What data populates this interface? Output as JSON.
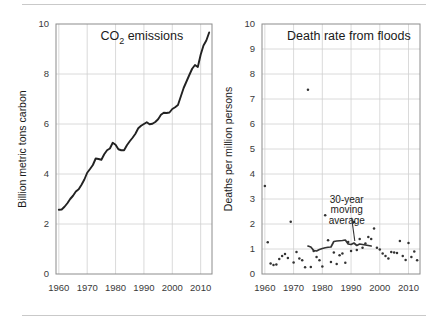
{
  "figure": {
    "background": "#ffffff",
    "ink": "#222222",
    "grid_color": "#d0d0d0",
    "frame_color": "#8c8c8c",
    "rule_top": true,
    "rule_bottom": true
  },
  "chart_data": [
    {
      "id": "co2-emissions",
      "type": "line",
      "title": "CO2 emissions",
      "title_parts": {
        "main": "CO",
        "sub": "2",
        "tail": " emissions"
      },
      "xlabel": "",
      "ylabel": "Billion metric tons carbon",
      "xlim": [
        1959,
        2014
      ],
      "ylim": [
        0,
        10
      ],
      "xticks": [
        1960,
        1970,
        1980,
        1990,
        2000,
        2010
      ],
      "xticklabels": [
        "1960",
        "1970",
        "1980",
        "1990",
        "2000",
        "2010"
      ],
      "yticks": [
        0,
        2,
        4,
        6,
        8,
        10
      ],
      "yticklabels": [
        "0",
        "2",
        "4",
        "6",
        "8",
        "10"
      ],
      "grid": true,
      "legend": "none",
      "series": [
        {
          "name": "Global CO2 emissions",
          "color": "#222222",
          "x": [
            1960,
            1961,
            1962,
            1963,
            1964,
            1965,
            1966,
            1967,
            1968,
            1969,
            1970,
            1971,
            1972,
            1973,
            1974,
            1975,
            1976,
            1977,
            1978,
            1979,
            1980,
            1981,
            1982,
            1983,
            1984,
            1985,
            1986,
            1987,
            1988,
            1989,
            1990,
            1991,
            1992,
            1993,
            1994,
            1995,
            1996,
            1997,
            1998,
            1999,
            2000,
            2001,
            2002,
            2003,
            2004,
            2005,
            2006,
            2007,
            2008,
            2009,
            2010,
            2011,
            2012,
            2013
          ],
          "values": [
            2.57,
            2.58,
            2.69,
            2.83,
            3.0,
            3.13,
            3.3,
            3.39,
            3.57,
            3.78,
            4.05,
            4.2,
            4.36,
            4.62,
            4.6,
            4.57,
            4.79,
            4.95,
            5.02,
            5.25,
            5.17,
            4.99,
            4.95,
            4.95,
            5.15,
            5.31,
            5.45,
            5.61,
            5.83,
            5.93,
            6.0,
            6.07,
            5.99,
            6.01,
            6.08,
            6.19,
            6.37,
            6.45,
            6.44,
            6.46,
            6.6,
            6.67,
            6.76,
            7.1,
            7.44,
            7.7,
            7.96,
            8.21,
            8.36,
            8.28,
            8.77,
            9.14,
            9.34,
            9.66
          ]
        }
      ]
    },
    {
      "id": "flood-death-rate",
      "type": "scatter",
      "title": "Death rate from floods",
      "xlabel": "",
      "ylabel": "Deaths per million persons",
      "xlim": [
        1959,
        2014
      ],
      "ylim": [
        0,
        10
      ],
      "xticks": [
        1960,
        1970,
        1980,
        1990,
        2000,
        2010
      ],
      "xticklabels": [
        "1960",
        "1970",
        "1980",
        "1990",
        "2000",
        "2010"
      ],
      "yticks": [
        0,
        1,
        2,
        3,
        4,
        5,
        6,
        7,
        8,
        9,
        10
      ],
      "yticklabels": [
        "0",
        "1",
        "2",
        "3",
        "4",
        "5",
        "6",
        "7",
        "8",
        "9",
        "10"
      ],
      "grid": true,
      "legend": "none",
      "annotation": {
        "text_lines": [
          "30-year",
          "moving",
          "average"
        ],
        "text_x": 1988.5,
        "text_y": 2.85,
        "leader_from": [
          1990.2,
          2.25
        ],
        "leader_to": [
          1991.3,
          1.32
        ]
      },
      "series": [
        {
          "name": "Annual flood death rate",
          "type": "scatter",
          "color": "#333333",
          "points": [
            [
              1960,
              3.52
            ],
            [
              1961,
              1.27
            ],
            [
              1962,
              0.42
            ],
            [
              1963,
              0.36
            ],
            [
              1964,
              0.38
            ],
            [
              1965,
              0.6
            ],
            [
              1966,
              0.72
            ],
            [
              1967,
              0.8
            ],
            [
              1968,
              0.64
            ],
            [
              1969,
              2.09
            ],
            [
              1970,
              0.46
            ],
            [
              1971,
              0.88
            ],
            [
              1972,
              0.62
            ],
            [
              1973,
              0.55
            ],
            [
              1974,
              0.27
            ],
            [
              1975,
              7.37
            ],
            [
              1976,
              0.28
            ],
            [
              1977,
              0.92
            ],
            [
              1978,
              0.68
            ],
            [
              1979,
              0.55
            ],
            [
              1980,
              0.3
            ],
            [
              1981,
              2.35
            ],
            [
              1982,
              1.35
            ],
            [
              1983,
              0.48
            ],
            [
              1984,
              0.86
            ],
            [
              1985,
              0.4
            ],
            [
              1986,
              0.75
            ],
            [
              1987,
              0.82
            ],
            [
              1988,
              0.45
            ],
            [
              1989,
              1.28
            ],
            [
              1990,
              0.92
            ],
            [
              1991,
              2.08
            ],
            [
              1992,
              0.96
            ],
            [
              1993,
              1.4
            ],
            [
              1994,
              1.05
            ],
            [
              1995,
              1.22
            ],
            [
              1996,
              1.48
            ],
            [
              1997,
              1.4
            ],
            [
              1998,
              1.82
            ],
            [
              1999,
              1.05
            ],
            [
              2000,
              0.98
            ],
            [
              2001,
              0.82
            ],
            [
              2002,
              0.72
            ],
            [
              2003,
              0.62
            ],
            [
              2004,
              0.88
            ],
            [
              2005,
              0.86
            ],
            [
              2006,
              0.84
            ],
            [
              2007,
              1.32
            ],
            [
              2008,
              0.72
            ],
            [
              2009,
              0.56
            ],
            [
              2010,
              1.24
            ],
            [
              2011,
              0.68
            ],
            [
              2012,
              0.9
            ],
            [
              2013,
              0.55
            ]
          ]
        },
        {
          "name": "30-year moving average",
          "type": "line",
          "color": "#333333",
          "x": [
            1975,
            1976,
            1977,
            1978,
            1979,
            1980,
            1981,
            1982,
            1983,
            1984,
            1985,
            1986,
            1987,
            1988,
            1989,
            1990,
            1991,
            1992,
            1993,
            1994,
            1995,
            1996,
            1997
          ],
          "values": [
            1.12,
            1.08,
            0.94,
            0.92,
            0.98,
            1.02,
            1.05,
            1.07,
            1.08,
            1.3,
            1.32,
            1.33,
            1.34,
            1.36,
            1.2,
            1.18,
            1.24,
            1.14,
            1.2,
            1.18,
            1.16,
            1.14,
            1.12
          ]
        }
      ]
    }
  ]
}
